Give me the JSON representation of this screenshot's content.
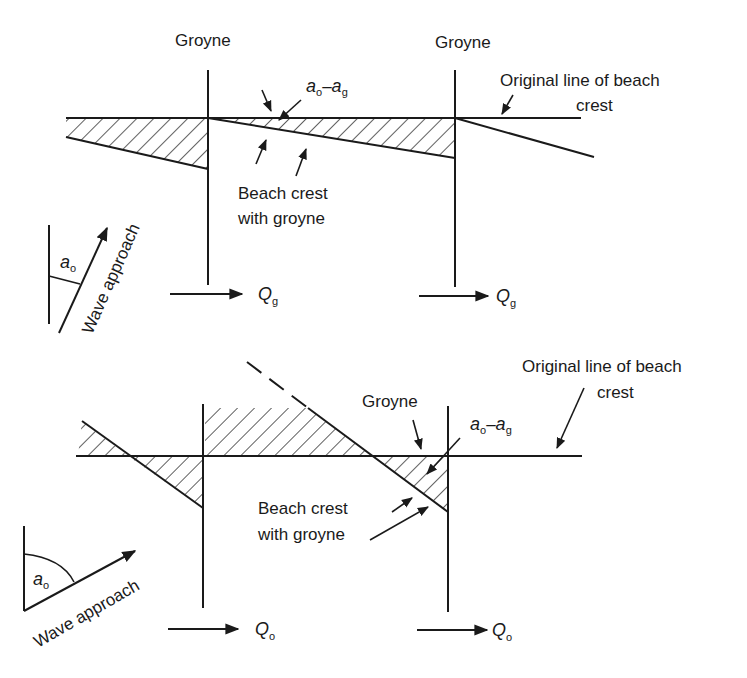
{
  "top_diagram": {
    "groyne_left_label": "Groyne",
    "groyne_right_label": "Groyne",
    "angle_diff_label": {
      "a": "a",
      "sub_o": "o",
      "dash": "–",
      "a2": "a",
      "sub_g": "g"
    },
    "original_line_label": [
      "Original line of beach",
      "crest"
    ],
    "beach_crest_label": [
      "Beach crest",
      "with groyne"
    ],
    "wave_approach_label": "Wave approach",
    "angle_label": {
      "a": "a",
      "sub": "o"
    },
    "transport_left": {
      "q": "Q",
      "sub": "g"
    },
    "transport_right": {
      "q": "Q",
      "sub": "g"
    }
  },
  "bottom_diagram": {
    "groyne_label": "Groyne",
    "angle_diff_label": {
      "a": "a",
      "sub_o": "o",
      "dash": "–",
      "a2": "a",
      "sub_g": "g"
    },
    "original_line_label": [
      "Original line of beach",
      "crest"
    ],
    "beach_crest_label": [
      "Beach crest",
      "with groyne"
    ],
    "wave_approach_label": "Wave approach",
    "angle_label": {
      "a": "a",
      "sub": "o"
    },
    "transport_left": {
      "q": "Q",
      "sub": "o"
    },
    "transport_right": {
      "q": "Q",
      "sub": "o"
    }
  },
  "colors": {
    "ink": "#1a1a1a",
    "background": "#ffffff"
  }
}
